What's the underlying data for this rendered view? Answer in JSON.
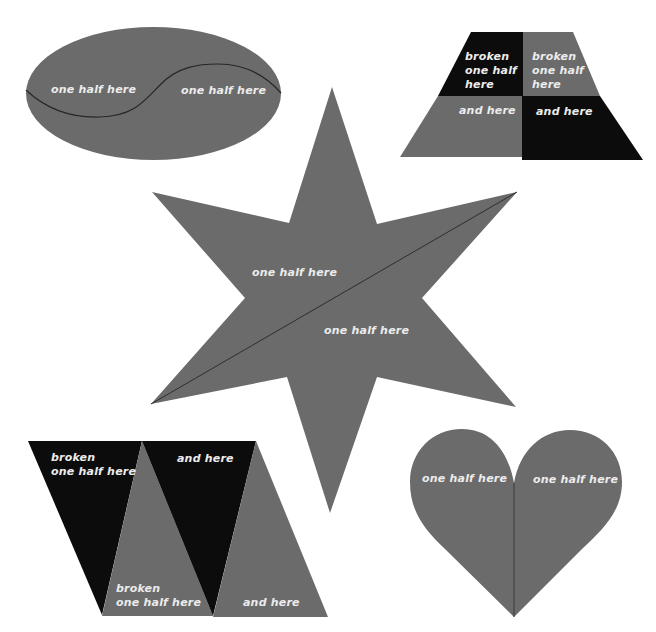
{
  "colors": {
    "background": "#ffffff",
    "gray": "#6b6b6b",
    "black": "#0c0c0c",
    "divider": "#2a2a2a",
    "label": "#ececec"
  },
  "ellipse": {
    "left_label": "one half here",
    "right_label": "one half here"
  },
  "trapezoid": {
    "top_left_label": "broken\none half\nhere",
    "top_right_label": "broken\none half\nhere",
    "bottom_left_label": "and here",
    "bottom_right_label": "and here"
  },
  "star": {
    "upper_label": "one half here",
    "lower_label": "one half here"
  },
  "parallelogram": {
    "top_left_label": "broken\none half here",
    "top_right_label": "and here",
    "bottom_left_label": "broken\none half here",
    "bottom_right_label": "and here"
  },
  "heart": {
    "left_label": "one half here",
    "right_label": "one half here"
  }
}
